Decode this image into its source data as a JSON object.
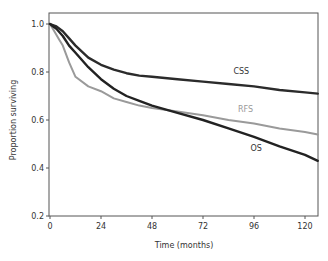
{
  "chart_data": {
    "type": "line",
    "title": "",
    "xlabel": "Time (months)",
    "ylabel": "Proportion surviving",
    "xlim": [
      0,
      126
    ],
    "ylim": [
      0.2,
      1.0
    ],
    "xticks": [
      0,
      24,
      48,
      72,
      96,
      120
    ],
    "yticks": [
      0.2,
      0.4,
      0.6,
      0.8,
      1.0
    ],
    "ytick_labels": [
      "0.2",
      "0.4",
      "0.6",
      "0.8",
      "1.0"
    ],
    "grid": false,
    "legend": "inline labels",
    "series": [
      {
        "name": "CSS",
        "color": "#2b2b2b",
        "label_pos": [
          90,
          0.79
        ],
        "x": [
          0,
          3,
          6,
          9,
          12,
          18,
          24,
          30,
          36,
          42,
          48,
          60,
          72,
          84,
          96,
          108,
          120,
          126
        ],
        "values": [
          1.0,
          0.99,
          0.97,
          0.94,
          0.91,
          0.86,
          0.83,
          0.81,
          0.795,
          0.785,
          0.78,
          0.77,
          0.76,
          0.75,
          0.74,
          0.725,
          0.715,
          0.71
        ]
      },
      {
        "name": "RFS",
        "color": "#9a9a9a",
        "label_pos": [
          92,
          0.635
        ],
        "x": [
          0,
          2,
          4,
          6,
          9,
          12,
          18,
          24,
          30,
          36,
          42,
          48,
          60,
          72,
          84,
          96,
          108,
          120,
          126
        ],
        "values": [
          1.0,
          0.97,
          0.94,
          0.91,
          0.84,
          0.78,
          0.74,
          0.72,
          0.69,
          0.675,
          0.66,
          0.65,
          0.635,
          0.62,
          0.6,
          0.585,
          0.565,
          0.55,
          0.54
        ]
      },
      {
        "name": "OS",
        "color": "#222222",
        "label_pos": [
          97,
          0.47
        ],
        "x": [
          0,
          3,
          6,
          9,
          12,
          18,
          24,
          30,
          36,
          42,
          48,
          60,
          72,
          84,
          96,
          108,
          120,
          126
        ],
        "values": [
          1.0,
          0.98,
          0.95,
          0.91,
          0.88,
          0.82,
          0.77,
          0.73,
          0.7,
          0.68,
          0.66,
          0.63,
          0.6,
          0.565,
          0.53,
          0.49,
          0.455,
          0.43
        ]
      }
    ]
  }
}
